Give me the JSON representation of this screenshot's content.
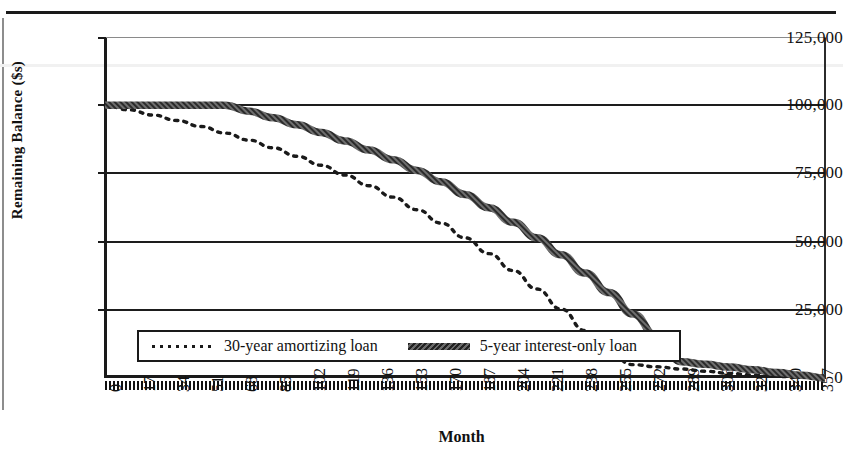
{
  "chart_data": {
    "type": "line",
    "title": "",
    "xlabel": "Month",
    "ylabel": "Remaining Balance ($s)",
    "grid": true,
    "legend_position": "inside-bottom-left",
    "xlim": [
      0,
      360
    ],
    "ylim": [
      0,
      125000
    ],
    "yticks": [
      0,
      25000,
      50000,
      75000,
      100000,
      125000
    ],
    "ytick_labels": [
      "0",
      "25,000",
      "50,000",
      "75,000",
      "100,000",
      "125,000"
    ],
    "xticks": [
      0,
      17,
      34,
      51,
      68,
      85,
      102,
      119,
      136,
      153,
      170,
      187,
      204,
      221,
      238,
      255,
      272,
      289,
      306,
      323,
      340,
      357
    ],
    "xtick_labels": [
      "0",
      "17",
      "34",
      "51",
      "68",
      "85",
      "102",
      "119",
      "136",
      "153",
      "170",
      "187",
      "204",
      "221",
      "238",
      "255",
      "272",
      "289",
      "306",
      "323",
      "340",
      "357"
    ],
    "series": [
      {
        "name": "30-year amortizing loan",
        "style": "dotted",
        "color": "#1a1a1a",
        "x": [
          0,
          12,
          24,
          36,
          48,
          60,
          72,
          84,
          96,
          108,
          120,
          132,
          144,
          156,
          168,
          180,
          192,
          204,
          216,
          228,
          240,
          252,
          264,
          276,
          288,
          300,
          312,
          324,
          336,
          348,
          360
        ],
        "y": [
          100000,
          98300,
          96400,
          94400,
          92200,
          89800,
          87200,
          84400,
          81300,
          78000,
          74400,
          70500,
          66300,
          61700,
          56800,
          51400,
          45600,
          39400,
          32600,
          25300,
          17400,
          8800,
          4900,
          4100,
          3300,
          2500,
          1700,
          1100,
          600,
          250,
          0
        ]
      },
      {
        "name": "5-year interest-only loan",
        "style": "solid-thick",
        "color": "#3a3a3a",
        "x": [
          0,
          12,
          24,
          36,
          48,
          60,
          72,
          84,
          96,
          108,
          120,
          132,
          144,
          156,
          168,
          180,
          192,
          204,
          216,
          228,
          240,
          252,
          264,
          276,
          288,
          300,
          312,
          324,
          336,
          348,
          360
        ],
        "y": [
          100000,
          100000,
          100000,
          100000,
          100000,
          100000,
          97800,
          95400,
          92800,
          90000,
          86900,
          83600,
          80000,
          76100,
          71900,
          67300,
          62400,
          57100,
          51400,
          45200,
          38500,
          31300,
          23500,
          15100,
          6000,
          5000,
          4000,
          3000,
          2000,
          1000,
          0
        ]
      }
    ],
    "annotations": [
      "Solid curve stays flat at 100,000 through month 60 (interest-only period), then amortizes.",
      "Curves cross near month 190 at about 74,000 and again near month 260 at about 27,000."
    ]
  },
  "axes": {
    "y_label": "Remaining Balance ($s)",
    "x_label": "Month",
    "y_tick_labels": [
      "125,000",
      "100,000",
      "75,000",
      "50,000",
      "25,000",
      "0"
    ],
    "x_tick_labels": [
      "0",
      "17",
      "34",
      "51",
      "68",
      "85",
      "102",
      "119",
      "136",
      "153",
      "170",
      "187",
      "204",
      "221",
      "238",
      "255",
      "272",
      "289",
      "306",
      "323",
      "340",
      "357"
    ]
  },
  "legend": {
    "entries": [
      {
        "label": "30-year amortizing loan",
        "swatch": "dotted-line-swatch"
      },
      {
        "label": "5-year interest-only loan",
        "swatch": "thick-solid-line-swatch"
      }
    ]
  },
  "colors": {
    "ink": "#1a1a1a",
    "grid": "#1d1d1d",
    "series_solid": "#3a3a3a",
    "background": "#ffffff"
  }
}
